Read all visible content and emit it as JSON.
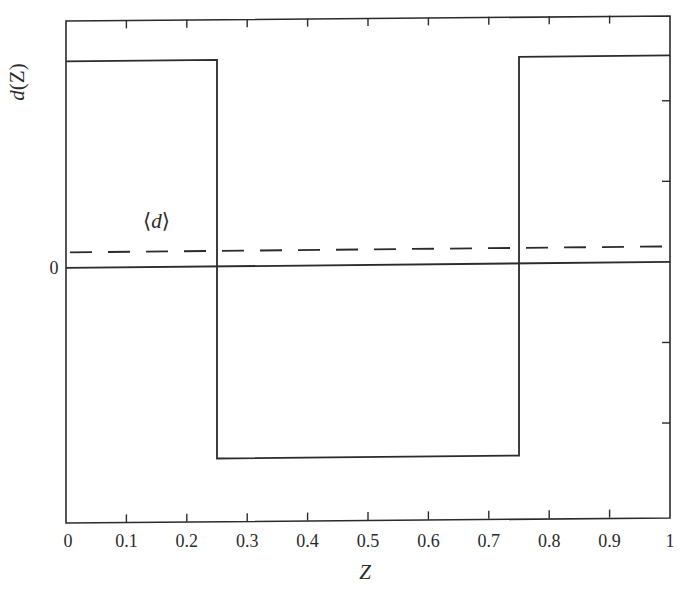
{
  "chart_data": {
    "type": "line",
    "title": "",
    "xlabel": "Z",
    "ylabel": "d(Z)",
    "xlim": [
      0,
      1
    ],
    "ylim": [
      -1.23,
      1.2
    ],
    "x_ticks": [
      0,
      0.1,
      0.2,
      0.3,
      0.4,
      0.5,
      0.6,
      0.7,
      0.8,
      0.9,
      1
    ],
    "x_tick_labels": [
      "0",
      "0.1",
      "0.2",
      "0.3",
      "0.4",
      "0.5",
      "0.6",
      "0.7",
      "0.8",
      "0.9",
      "1"
    ],
    "y_ticks": [
      -0.78,
      -0.39,
      0,
      0.39,
      0.78
    ],
    "y_tick_labels": [
      "",
      "",
      "0",
      "",
      ""
    ],
    "grid": false,
    "series": [
      {
        "name": "d(Z)",
        "style": "solid",
        "x": [
          0,
          0.25,
          0.25,
          0.75,
          0.75,
          1
        ],
        "y": [
          1.0,
          1.0,
          -0.93,
          -0.93,
          1.0,
          1.0
        ]
      },
      {
        "name": "zero",
        "style": "solid",
        "x": [
          0,
          1
        ],
        "y": [
          0,
          0
        ]
      },
      {
        "name": "⟨d⟩",
        "style": "dashed",
        "x": [
          0,
          1
        ],
        "y": [
          0.075,
          0.075
        ]
      }
    ],
    "annotations": [
      {
        "text": "⟨d⟩",
        "x": 0.13,
        "y": 0.22
      }
    ]
  }
}
